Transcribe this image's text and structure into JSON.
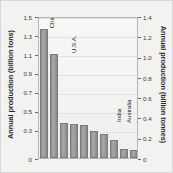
{
  "chart_data": {
    "type": "bar",
    "title": "",
    "categories": [
      "China",
      "U.S.A.",
      "India",
      "Australia",
      "South Africa",
      "Russia",
      "Germany",
      "Poland",
      "North Korea",
      "Ukraine"
    ],
    "values": [
      1.36,
      1.1,
      0.37,
      0.36,
      0.35,
      0.29,
      0.25,
      0.19,
      0.1,
      0.08
    ],
    "xlabel": "",
    "ylabel": "Annual production (billion tons)",
    "ylabel_right": "Annual production (billion tonnes)",
    "ylim": [
      0,
      1.5
    ],
    "ylim_right": [
      0,
      1.4
    ],
    "yticks": [
      "1.5",
      "1.3",
      "1.1",
      "0.9",
      "0.7",
      "0.5",
      "0.3",
      "0"
    ],
    "ytick_values": [
      1.5,
      1.3,
      1.1,
      0.9,
      0.7,
      0.5,
      0.3,
      0
    ],
    "yticks_right": [
      "1.4",
      "1.2",
      "1.0",
      "0.8",
      "0.6",
      "0.4",
      "0.2",
      "0"
    ],
    "ytick_values_right": [
      1.4,
      1.2,
      1.0,
      0.8,
      0.6,
      0.4,
      0.2,
      0
    ],
    "grid": true,
    "legend": "none",
    "bar_color": "#9b9b99",
    "plot_bg": "#f2f2f0"
  }
}
